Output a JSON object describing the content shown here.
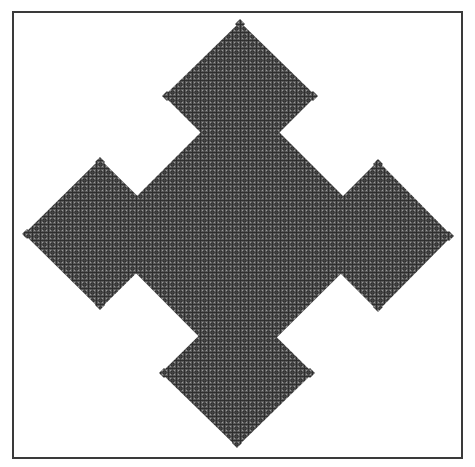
{
  "figure": {
    "description": "Fractal of nested rotated squares (diamonds): a central diamond with four smaller diamonds attached at each side, each with tiny diamonds at their outer corners",
    "colors": {
      "background": "#ffffff",
      "border": "#3a3a3a",
      "fill_base": "#5a5a5a",
      "fill_dark": "#2e2e2e",
      "fill_light": "#9a9a9a"
    },
    "frame": {
      "x": 13,
      "y": 12,
      "width": 449,
      "height": 446,
      "stroke_width": 2
    },
    "center_diamond": {
      "points": [
        [
          240,
          93
        ],
        [
          381,
          234
        ],
        [
          238,
          376
        ],
        [
          98,
          235
        ]
      ]
    },
    "arm_diamonds": [
      {
        "name": "top",
        "points": [
          [
            240,
            22
          ],
          [
            316,
            96
          ],
          [
            240,
            172
          ],
          [
            164,
            96
          ]
        ]
      },
      {
        "name": "left",
        "points": [
          [
            100,
            159
          ],
          [
            176,
            234
          ],
          [
            100,
            309
          ],
          [
            24,
            234
          ]
        ]
      },
      {
        "name": "right",
        "points": [
          [
            378,
            161
          ],
          [
            452,
            236
          ],
          [
            378,
            311
          ],
          [
            303,
            236
          ]
        ]
      },
      {
        "name": "bottom",
        "points": [
          [
            237,
            298
          ],
          [
            313,
            373
          ],
          [
            237,
            447
          ],
          [
            161,
            373
          ]
        ]
      }
    ],
    "tip_diamonds": [
      {
        "name": "top-top",
        "cx": 240,
        "cy": 24,
        "r": 5
      },
      {
        "name": "top-left",
        "cx": 167,
        "cy": 96,
        "r": 5
      },
      {
        "name": "top-right",
        "cx": 313,
        "cy": 96,
        "r": 5
      },
      {
        "name": "left-top",
        "cx": 100,
        "cy": 162,
        "r": 5
      },
      {
        "name": "left-left",
        "cx": 27,
        "cy": 234,
        "r": 5
      },
      {
        "name": "left-bottom",
        "cx": 100,
        "cy": 305,
        "r": 5
      },
      {
        "name": "right-top",
        "cx": 378,
        "cy": 164,
        "r": 5
      },
      {
        "name": "right-right",
        "cx": 449,
        "cy": 236,
        "r": 5
      },
      {
        "name": "right-bottom",
        "cx": 378,
        "cy": 307,
        "r": 5
      },
      {
        "name": "bottom-left",
        "cx": 164,
        "cy": 373,
        "r": 5
      },
      {
        "name": "bottom-right",
        "cx": 310,
        "cy": 373,
        "r": 5
      },
      {
        "name": "bottom-bottom",
        "cx": 237,
        "cy": 443,
        "r": 5
      }
    ]
  }
}
